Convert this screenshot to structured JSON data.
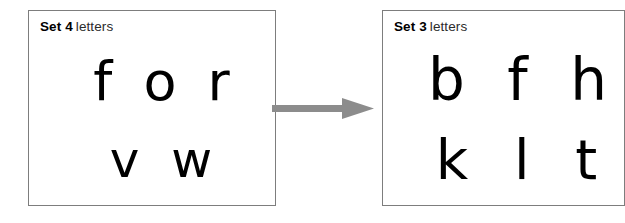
{
  "diagram": {
    "type": "transition-arrow-diagram",
    "background_color": "#ffffff",
    "boxes": [
      {
        "id": "left",
        "header": {
          "set_label": "Set 4",
          "category_label": "letters"
        },
        "rows": [
          {
            "letters": "f o r"
          },
          {
            "letters": "v w"
          }
        ],
        "border_color": "#7d7d7d"
      },
      {
        "id": "right",
        "header": {
          "set_label": "Set 3",
          "category_label": "letters"
        },
        "rows": [
          {
            "letters": "b f h"
          },
          {
            "letters": "k l t"
          }
        ],
        "border_color": "#7d7d7d"
      }
    ],
    "arrow": {
      "direction": "right",
      "color": "#8c8c8c"
    }
  }
}
